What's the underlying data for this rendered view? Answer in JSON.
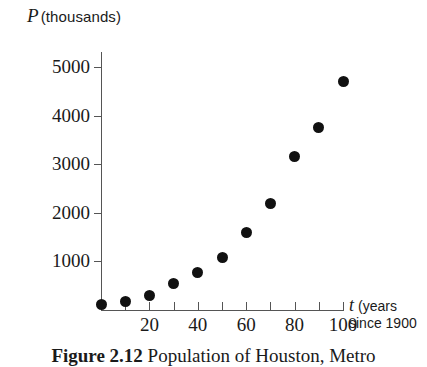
{
  "figure": {
    "caption_label": "Figure 2.12",
    "caption_text": "Population of Houston, Metro"
  },
  "chart_data": {
    "type": "scatter",
    "title": "",
    "xlabel_symbol": "t",
    "xlabel_unit": "(years",
    "xlabel_unit_line2": "since 1900",
    "ylabel_symbol": "P",
    "ylabel_unit": "(thousands)",
    "x": [
      0,
      10,
      20,
      30,
      40,
      50,
      60,
      70,
      80,
      90,
      100
    ],
    "values": [
      120,
      180,
      300,
      550,
      780,
      1080,
      1600,
      2200,
      3150,
      3750,
      4700
    ],
    "xticks": [
      0,
      10,
      20,
      30,
      40,
      50,
      60,
      70,
      80,
      90,
      100
    ],
    "xticklabels": [
      "",
      "",
      "20",
      "",
      "40",
      "",
      "60",
      "",
      "80",
      "",
      "100"
    ],
    "yticks": [
      1000,
      2000,
      3000,
      4000,
      5000
    ],
    "yticklabels": [
      "1000",
      "2000",
      "3000",
      "4000",
      "5000"
    ],
    "xlim": [
      0,
      100
    ],
    "ylim": [
      0,
      5300
    ],
    "grid": false,
    "legend": false,
    "marker_color": "#111111",
    "axis_color": "#555555"
  }
}
